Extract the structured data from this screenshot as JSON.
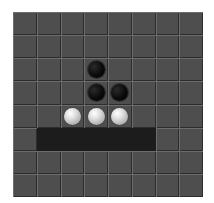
{
  "board": {
    "rows": 8,
    "cols": 8,
    "colors": {
      "cell": "#4e4e4e",
      "highlight_cell": "#1c1c1c",
      "black_piece": "#000000",
      "white_piece": "#e4e4e4"
    },
    "highlighted_cells": [
      [
        5,
        1
      ],
      [
        5,
        2
      ],
      [
        5,
        3
      ],
      [
        5,
        4
      ],
      [
        5,
        5
      ]
    ],
    "pieces": [
      {
        "row": 2,
        "col": 3,
        "color": "black"
      },
      {
        "row": 3,
        "col": 3,
        "color": "black"
      },
      {
        "row": 3,
        "col": 4,
        "color": "black"
      },
      {
        "row": 4,
        "col": 2,
        "color": "white"
      },
      {
        "row": 4,
        "col": 3,
        "color": "white"
      },
      {
        "row": 4,
        "col": 4,
        "color": "white"
      }
    ]
  }
}
